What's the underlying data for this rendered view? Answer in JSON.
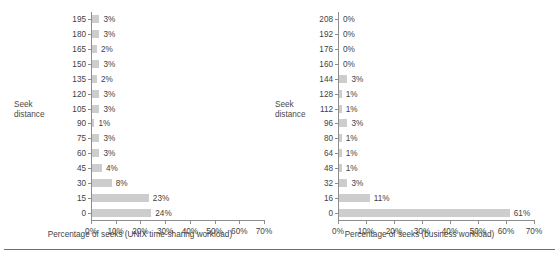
{
  "figure": {
    "background": "#ffffff",
    "bar_color": "#cdcdcd",
    "axis_color": "#8d8d8d",
    "text_color": "#3f3f3f",
    "rule_y": 249
  },
  "panels": [
    {
      "id": "unix",
      "axis_title_line1": "Seek",
      "axis_title_line2": "distance",
      "xlabel": "Percentage of seeks (UNIX time-sharing workload)",
      "xticks": [
        "0%",
        "10%",
        "20%",
        "30%",
        "40%",
        "50%",
        "60%",
        "70%"
      ],
      "ycategories": [
        "195",
        "180",
        "165",
        "150",
        "135",
        "120",
        "105",
        "90",
        "75",
        "60",
        "45",
        "30",
        "15",
        "0"
      ],
      "values": [
        3,
        3,
        2,
        3,
        2,
        3,
        3,
        1,
        3,
        3,
        4,
        8,
        23,
        24
      ],
      "labels": [
        "3%",
        "3%",
        "2%",
        "3%",
        "2%",
        "3%",
        "3%",
        "1%",
        "3%",
        "3%",
        "4%",
        "8%",
        "23%",
        "24%"
      ]
    },
    {
      "id": "business",
      "axis_title_line1": "Seek",
      "axis_title_line2": "distance",
      "xlabel": "Percentage of seeks (business workload)",
      "xticks": [
        "0%",
        "10%",
        "20%",
        "30%",
        "40%",
        "50%",
        "60%",
        "70%"
      ],
      "ycategories": [
        "208",
        "192",
        "176",
        "160",
        "144",
        "128",
        "112",
        "96",
        "80",
        "64",
        "48",
        "32",
        "16",
        "0"
      ],
      "values": [
        0,
        0,
        0,
        0,
        3,
        1,
        1,
        3,
        1,
        1,
        1,
        3,
        11,
        61
      ],
      "labels": [
        "0%",
        "0%",
        "0%",
        "0%",
        "3%",
        "1%",
        "1%",
        "3%",
        "1%",
        "1%",
        "1%",
        "3%",
        "11%",
        "61%"
      ]
    }
  ],
  "chart_data": [
    {
      "type": "bar",
      "orientation": "horizontal",
      "title": "",
      "xlabel": "Percentage of seeks (UNIX time-sharing workload)",
      "ylabel": "Seek distance",
      "categories": [
        195,
        180,
        165,
        150,
        135,
        120,
        105,
        90,
        75,
        60,
        45,
        30,
        15,
        0
      ],
      "values": [
        3,
        3,
        2,
        3,
        2,
        3,
        3,
        1,
        3,
        3,
        4,
        8,
        23,
        24
      ],
      "data_labels": [
        "3%",
        "3%",
        "2%",
        "3%",
        "2%",
        "3%",
        "3%",
        "1%",
        "3%",
        "3%",
        "4%",
        "8%",
        "23%",
        "24%"
      ],
      "xlim": [
        0,
        70
      ],
      "xticks": [
        0,
        10,
        20,
        30,
        40,
        50,
        60,
        70
      ],
      "xtick_labels": [
        "0%",
        "10%",
        "20%",
        "30%",
        "40%",
        "50%",
        "60%",
        "70%"
      ],
      "grid": false,
      "legend": "none",
      "units": "percent"
    },
    {
      "type": "bar",
      "orientation": "horizontal",
      "title": "",
      "xlabel": "Percentage of seeks (business workload)",
      "ylabel": "Seek distance",
      "categories": [
        208,
        192,
        176,
        160,
        144,
        128,
        112,
        96,
        80,
        64,
        48,
        32,
        16,
        0
      ],
      "values": [
        0,
        0,
        0,
        0,
        3,
        1,
        1,
        3,
        1,
        1,
        1,
        3,
        11,
        61
      ],
      "data_labels": [
        "0%",
        "0%",
        "0%",
        "0%",
        "3%",
        "1%",
        "1%",
        "3%",
        "1%",
        "1%",
        "1%",
        "3%",
        "11%",
        "61%"
      ],
      "xlim": [
        0,
        70
      ],
      "xticks": [
        0,
        10,
        20,
        30,
        40,
        50,
        60,
        70
      ],
      "xtick_labels": [
        "0%",
        "10%",
        "20%",
        "30%",
        "40%",
        "50%",
        "60%",
        "70%"
      ],
      "grid": false,
      "legend": "none",
      "units": "percent"
    }
  ]
}
